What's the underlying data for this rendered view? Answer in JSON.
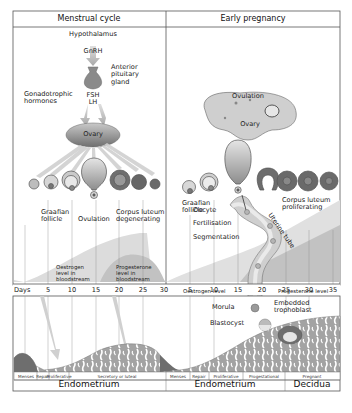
{
  "panels": {
    "left": {
      "title": "Menstrual cycle",
      "labels": {
        "hypothalamus": "Hypothalamus",
        "gnrh": "GnRH",
        "anterior_pituitary": [
          "Anterior",
          "pituitary",
          "gland"
        ],
        "gonadotrophic": [
          "Gonadotrophic",
          "hormones"
        ],
        "fsh": "FSH",
        "lh": "LH",
        "ovary": "Ovary",
        "graafian_follicle": [
          "Graafian",
          "follicle"
        ],
        "ovulation": "Ovulation",
        "corpus_luteum": [
          "Corpus luteum",
          "degenerating"
        ],
        "oestrogen": [
          "Oestrogen",
          "level in",
          "bloodstream"
        ],
        "progesterone": [
          "Progesterone",
          "level in",
          "bloodstream"
        ]
      },
      "days": [
        "5",
        "10",
        "15",
        "20",
        "25",
        "30"
      ],
      "phases": [
        "Menses",
        "Repair",
        "Proliferative",
        "Secretory or luteal"
      ],
      "footer": "Endometrium"
    },
    "right": {
      "title": "Early pregnancy",
      "labels": {
        "ovulation": "Ovulation",
        "ovary": "Ovary",
        "graafian_follicle": [
          "Graafian",
          "follicle"
        ],
        "corpus_luteum": [
          "Corpus luteum",
          "proliferating"
        ],
        "oocyte": "Oocyte",
        "fertilisation": "Fertilisation",
        "segmentation": "Segmentation",
        "uterine_tube": "Uterine tube",
        "oestrogen": "Oestrogen level",
        "progesterone": "Progesterone level",
        "morula": "Morula",
        "blastocyst": "Blastocyst",
        "embedded": [
          "Embedded",
          "trophoblast"
        ]
      },
      "days": [
        "5",
        "10",
        "15",
        "20",
        "25",
        "30",
        "35"
      ],
      "phases": [
        "Menses",
        "Repair",
        "Proliferative",
        "Progestational",
        "Pregnant"
      ],
      "footer_left": "Endometrium",
      "footer_right": "Decidua"
    }
  },
  "axis": {
    "label": "Days"
  },
  "colors": {
    "frame": "#555555",
    "hormone_light": "#d9d9d9",
    "hormone_dark": "#bdbdbd",
    "ovary": "#8f8f8f",
    "tissue": "#9c9c9c",
    "tissue_dark": "#6e6e6e"
  }
}
